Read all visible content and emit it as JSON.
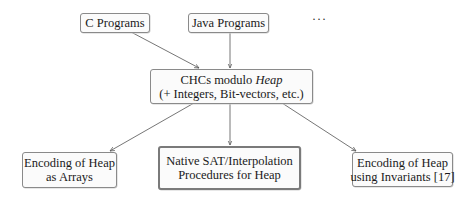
{
  "diagram": {
    "sources": [
      {
        "id": "c",
        "label": "C Programs"
      },
      {
        "id": "java",
        "label": "Java Programs"
      },
      {
        "id": "more",
        "label": "···"
      }
    ],
    "center": {
      "line1_prefix": "CHCs modulo ",
      "line1_italic": "Heap",
      "line2": "(+ Integers, Bit-vectors, etc.)"
    },
    "targets": [
      {
        "id": "arrays",
        "line1": "Encoding of Heap",
        "line2": "as Arrays",
        "highlighted": false
      },
      {
        "id": "native",
        "line1": "Native SAT/Interpolation",
        "line2": "Procedures for Heap",
        "highlighted": true
      },
      {
        "id": "invariants",
        "line1": "Encoding of Heap",
        "line2": "using Invariants [17]",
        "highlighted": false
      }
    ],
    "edges": [
      {
        "from": "c",
        "to": "center"
      },
      {
        "from": "java",
        "to": "center"
      },
      {
        "from": "center",
        "to": "arrays"
      },
      {
        "from": "center",
        "to": "native"
      },
      {
        "from": "center",
        "to": "invariants"
      }
    ]
  }
}
